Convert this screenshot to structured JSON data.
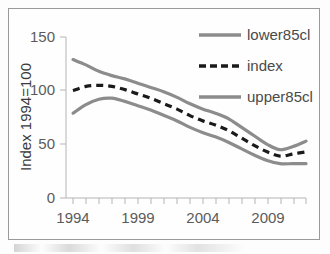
{
  "chart_data": {
    "type": "line",
    "title": "",
    "xlabel": "",
    "ylabel": "Index 1994=100",
    "xlim": [
      1994,
      2012
    ],
    "ylim": [
      0,
      150
    ],
    "grid": false,
    "legend_position": "top-right",
    "x": [
      1994,
      1995,
      1996,
      1997,
      1998,
      1999,
      2000,
      2001,
      2002,
      2003,
      2004,
      2005,
      2006,
      2007,
      2008,
      2009,
      2010,
      2011,
      2012
    ],
    "y_ticks": [
      0,
      50,
      100,
      150
    ],
    "y_tick_labels": [
      "0",
      "50",
      "100",
      "150"
    ],
    "x_ticks": [
      1994,
      1999,
      2004,
      2009
    ],
    "x_tick_labels": [
      "1994",
      "1999",
      "2004",
      "2009"
    ],
    "x_minor_ticks": [
      1995,
      1996,
      1997,
      1998,
      2000,
      2001,
      2002,
      2003,
      2005,
      2006,
      2007,
      2008,
      2010,
      2011,
      2012
    ],
    "series": [
      {
        "name": "lower85cl",
        "style": "solid",
        "color": "#8c8c8c",
        "values": [
          79,
          87,
          92,
          93,
          90,
          86,
          82,
          77,
          72,
          66,
          61,
          57,
          52,
          46,
          40,
          35,
          32,
          32,
          32
        ]
      },
      {
        "name": "index",
        "style": "dashed",
        "color": "#1a1a1a",
        "values": [
          100,
          104,
          105,
          104,
          101,
          97,
          93,
          88,
          83,
          77,
          72,
          68,
          63,
          56,
          49,
          43,
          39,
          41,
          43
        ]
      },
      {
        "name": "upper85cl",
        "style": "solid",
        "color": "#8c8c8c",
        "values": [
          129,
          124,
          118,
          114,
          111,
          107,
          103,
          99,
          94,
          88,
          83,
          79,
          74,
          66,
          58,
          50,
          45,
          48,
          53
        ]
      }
    ]
  },
  "axes": {
    "y_title": "Index 1994=100",
    "y_labels": [
      "150",
      "100",
      "50",
      "0"
    ],
    "x_labels": [
      "1994",
      "1999",
      "2004",
      "2009"
    ]
  },
  "legend": {
    "items": [
      {
        "label": "lower85cl",
        "swatch": "solid-line-swatch",
        "color": "#8c8c8c"
      },
      {
        "label": "index",
        "swatch": "dashed-line-swatch",
        "color": "#1a1a1a"
      },
      {
        "label": "upper85cl",
        "swatch": "solid-line-swatch",
        "color": "#8c8c8c"
      }
    ]
  }
}
